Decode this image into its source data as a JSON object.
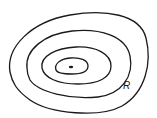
{
  "diagram": {
    "type": "contour-map",
    "contour_count": 4,
    "has_center_point": true,
    "region_label": "R",
    "stroke_color": "#1a1a1a",
    "background_color": "#ffffff"
  }
}
